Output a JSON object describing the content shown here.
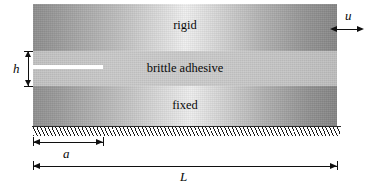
{
  "figure": {
    "type": "mechanics-schematic",
    "layers": [
      {
        "id": "rigid",
        "label": "rigid",
        "fill": "gradient-gray"
      },
      {
        "id": "adhesive",
        "label": "brittle adhesive",
        "fill": "flat-light-gray"
      },
      {
        "id": "fixed",
        "label": "fixed",
        "fill": "gradient-gray"
      }
    ],
    "annotations": {
      "displacement": {
        "symbol": "u",
        "name": "applied-displacement"
      },
      "thickness": {
        "symbol": "h",
        "name": "adhesive-thickness"
      },
      "crack_length": {
        "symbol": "a",
        "name": "crack-length"
      },
      "total_length": {
        "symbol": "L",
        "name": "specimen-length"
      }
    },
    "features": {
      "crack": "pre-crack",
      "support": "fixed-boundary-hatching"
    },
    "colors": {
      "ink": "#101010",
      "crack": "#ffffff",
      "adhesive": "#c8c8c8"
    }
  }
}
